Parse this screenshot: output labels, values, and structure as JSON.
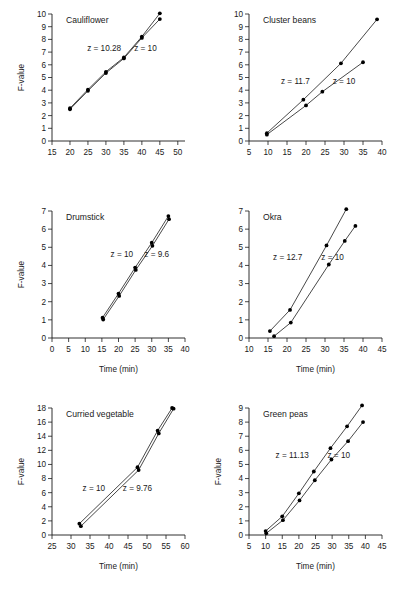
{
  "figure": {
    "axis_title_y": "F-value",
    "axis_title_x": "Time (min)"
  },
  "chart_data": [
    {
      "type": "line",
      "title": "Cauliflower",
      "xlabel": "",
      "ylabel": "F-value",
      "xlim": [
        15,
        52
      ],
      "ylim": [
        0,
        10
      ],
      "xticks": [
        15,
        20,
        25,
        30,
        35,
        40,
        45,
        50
      ],
      "yticks": [
        0,
        1,
        2,
        3,
        4,
        5,
        6,
        7,
        8,
        9,
        10
      ],
      "grid": false,
      "legend": "none",
      "annotations": [
        {
          "text": "z = 10.28",
          "x": 29.5,
          "y": 7.1
        },
        {
          "text": "z = 10",
          "x": 41.0,
          "y": 7.1
        }
      ],
      "series": [
        {
          "name": "z = 10.28",
          "x": [
            20.0,
            25.0,
            30.0,
            35.0,
            40.0,
            45.0
          ],
          "values": [
            2.58,
            4.05,
            5.45,
            6.58,
            8.22,
            10.05
          ]
        },
        {
          "name": "z = 10",
          "x": [
            20.0,
            25.0,
            30.0,
            35.0,
            40.0,
            45.0
          ],
          "values": [
            2.5,
            3.95,
            5.35,
            6.5,
            8.12,
            9.6
          ]
        }
      ]
    },
    {
      "type": "line",
      "title": "Cluster beans",
      "xlabel": "",
      "ylabel": "",
      "xlim": [
        5,
        40
      ],
      "ylim": [
        0,
        10
      ],
      "xticks": [
        5,
        10,
        15,
        20,
        25,
        30,
        35,
        40
      ],
      "yticks": [
        0,
        1,
        2,
        3,
        4,
        5,
        6,
        7,
        8,
        9,
        10
      ],
      "grid": false,
      "legend": "none",
      "annotations": [
        {
          "text": "z = 11.7",
          "x": 17.2,
          "y": 4.5
        },
        {
          "text": "z = 10",
          "x": 30.0,
          "y": 4.5
        }
      ],
      "series": [
        {
          "name": "z = 11.7",
          "x": [
            9.7,
            19.3,
            29.2,
            38.7
          ],
          "values": [
            0.62,
            3.25,
            6.12,
            9.58
          ]
        },
        {
          "name": "z = 10",
          "x": [
            9.7,
            20.0,
            24.3,
            35.0
          ],
          "values": [
            0.5,
            2.8,
            3.88,
            6.2
          ]
        }
      ]
    },
    {
      "type": "line",
      "title": "Drumstick",
      "xlabel": "Time (min)",
      "ylabel": "F-value",
      "xlim": [
        0,
        40
      ],
      "ylim": [
        0,
        7
      ],
      "xticks": [
        0,
        5,
        10,
        15,
        20,
        25,
        30,
        35,
        40
      ],
      "yticks": [
        0,
        1,
        2,
        3,
        4,
        5,
        6,
        7
      ],
      "grid": false,
      "legend": "none",
      "annotations": [
        {
          "text": "z = 10",
          "x": 21.0,
          "y": 4.45
        },
        {
          "text": "z = 9.6",
          "x": 31.5,
          "y": 4.45
        }
      ],
      "series": [
        {
          "name": "z = 10",
          "x": [
            15.2,
            20.0,
            25.0,
            30.0,
            35.0
          ],
          "values": [
            1.12,
            2.45,
            3.88,
            5.25,
            6.72
          ]
        },
        {
          "name": "z = 9.6",
          "x": [
            15.4,
            20.2,
            25.2,
            30.2,
            35.2
          ],
          "values": [
            1.02,
            2.32,
            3.75,
            5.08,
            6.55
          ]
        }
      ]
    },
    {
      "type": "line",
      "title": "Okra",
      "xlabel": "Time (min)",
      "ylabel": "",
      "xlim": [
        10,
        45
      ],
      "ylim": [
        0,
        7
      ],
      "xticks": [
        10,
        15,
        20,
        25,
        30,
        35,
        40,
        45
      ],
      "yticks": [
        0,
        1,
        2,
        3,
        4,
        5,
        6,
        7
      ],
      "grid": false,
      "legend": "none",
      "annotations": [
        {
          "text": "z = 12.7",
          "x": 20.2,
          "y": 4.3
        },
        {
          "text": "z = 10",
          "x": 32.0,
          "y": 4.3
        }
      ],
      "series": [
        {
          "name": "z = 12.7",
          "x": [
            15.5,
            20.8,
            30.4,
            35.6
          ],
          "values": [
            0.38,
            1.55,
            5.1,
            7.1
          ]
        },
        {
          "name": "z = 10",
          "x": [
            16.6,
            21.0,
            31.0,
            35.2,
            38.0
          ],
          "values": [
            0.1,
            0.85,
            4.05,
            5.35,
            6.18
          ]
        }
      ]
    },
    {
      "type": "line",
      "title": "Curried vegetable",
      "xlabel": "Time (min)",
      "ylabel": "F-value",
      "xlim": [
        25,
        60
      ],
      "ylim": [
        0,
        18
      ],
      "xticks": [
        25,
        30,
        35,
        40,
        45,
        50,
        55,
        60
      ],
      "yticks": [
        0,
        2,
        4,
        6,
        8,
        10,
        12,
        14,
        16,
        18
      ],
      "grid": false,
      "legend": "none",
      "annotations": [
        {
          "text": "z = 10",
          "x": 36.0,
          "y": 6.2
        },
        {
          "text": "z = 9.76",
          "x": 47.5,
          "y": 6.2
        }
      ],
      "series": [
        {
          "name": "z = 10",
          "x": [
            32.2,
            47.5,
            52.8,
            56.6
          ],
          "values": [
            1.6,
            9.6,
            14.8,
            18.0
          ]
        },
        {
          "name": "z = 9.76",
          "x": [
            32.6,
            47.8,
            53.1,
            57.0
          ],
          "values": [
            1.25,
            9.2,
            14.4,
            17.9
          ]
        }
      ]
    },
    {
      "type": "line",
      "title": "Green peas",
      "xlabel": "Time (min)",
      "ylabel": "F-value",
      "xlim": [
        5,
        45
      ],
      "ylim": [
        0,
        9
      ],
      "xticks": [
        5,
        10,
        15,
        20,
        25,
        30,
        35,
        40,
        45
      ],
      "yticks": [
        0,
        1,
        2,
        3,
        4,
        5,
        6,
        7,
        8,
        9
      ],
      "grid": false,
      "legend": "none",
      "annotations": [
        {
          "text": "z = 11.13",
          "x": 18.0,
          "y": 5.45
        },
        {
          "text": "z = 10",
          "x": 32.0,
          "y": 5.45
        }
      ],
      "series": [
        {
          "name": "z = 11.13",
          "x": [
            10.0,
            15.0,
            20.0,
            24.5,
            29.5,
            34.5,
            39.0
          ],
          "values": [
            0.28,
            1.32,
            2.95,
            4.5,
            6.15,
            7.7,
            9.18
          ]
        },
        {
          "name": "z = 10",
          "x": [
            10.2,
            15.2,
            20.2,
            24.8,
            29.8,
            34.8,
            39.3
          ],
          "values": [
            0.12,
            1.05,
            2.45,
            3.88,
            5.35,
            6.65,
            8.0
          ]
        }
      ]
    }
  ]
}
